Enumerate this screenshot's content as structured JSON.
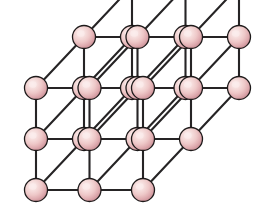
{
  "figure": {
    "background_color": "#ffffff",
    "width": 266,
    "height": 214
  },
  "chart_data": {
    "type": "scatter",
    "lattice": {
      "type": "simple-cubic",
      "nx": 3,
      "ny": 3,
      "nz": 3,
      "atom_count": 27,
      "bond_count": 54,
      "projection": "oblique",
      "origin_x": 36,
      "origin_y": 190,
      "step_x": 53.5,
      "step_y": -51,
      "depth_dx": 48,
      "depth_dy": -51
    },
    "atom_style": {
      "radius": 11.5,
      "fill_light": "#fbeceb",
      "fill_mid": "#edc3c4",
      "fill_dark": "#d79a9e",
      "fill_edge": "#b97d84",
      "stroke": "#1d1a1a",
      "stroke_width": 1.3,
      "highlight_offset_x": -0.28,
      "highlight_offset_y": -0.3
    },
    "bond_style": {
      "stroke": "#262425",
      "stroke_width": 2.1
    },
    "xlabel": "",
    "ylabel": "",
    "legend": []
  }
}
